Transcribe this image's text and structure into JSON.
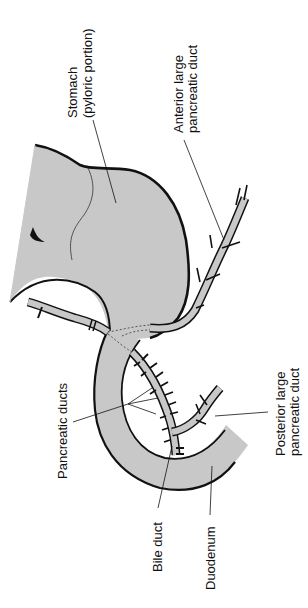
{
  "figure": {
    "type": "anatomical-diagram",
    "orientation": "rotated 90 degrees counter-clockwise (labels read bottom-to-top)"
  },
  "labels": {
    "stomach_line1": "Stomach",
    "stomach_line2": "(pyloric portion)",
    "anterior_line1": "Anterior large",
    "anterior_line2": "pancreatic duct",
    "pancreatic_ducts": "Pancreatic ducts",
    "posterior_line1": "Posterior large",
    "posterior_line2": "pancreatic duct",
    "bile_duct": "Bile duct",
    "duodenum": "Duodenum"
  },
  "colors": {
    "organ_fill": "#c8c8c8",
    "outline": "#111111",
    "background": "#ffffff"
  }
}
